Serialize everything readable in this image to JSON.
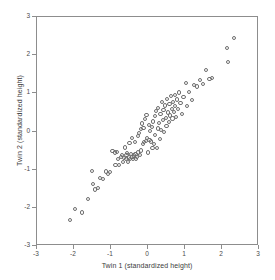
{
  "chart_data": {
    "type": "scatter",
    "title": "",
    "xlabel": "Twin 1 (standardized height)",
    "ylabel": "Twin 2 (standardized height)",
    "xlim": [
      -3,
      3
    ],
    "ylim": [
      -3,
      3
    ],
    "xticks": [
      -3,
      -2,
      -1,
      0,
      1,
      2,
      3
    ],
    "yticks": [
      -3,
      -2,
      -1,
      0,
      1,
      2,
      3
    ],
    "xtick_labels": [
      "-3",
      "-2",
      "-1",
      "0",
      "1",
      "2",
      "3"
    ],
    "ytick_labels": [
      "-3",
      "-2",
      "-1",
      "0",
      "1",
      "2",
      "3"
    ],
    "grid": false,
    "legend": null,
    "marker": "open-circle",
    "marker_color": "#6e6e6e",
    "frame_color": "#8d8d8d",
    "series": [
      {
        "name": "twin-pairs",
        "n_points": 112,
        "points": [
          [
            -2.1,
            -2.32
          ],
          [
            -1.98,
            -2.03
          ],
          [
            -1.78,
            -2.12
          ],
          [
            -1.62,
            -1.77
          ],
          [
            -1.52,
            -1.04
          ],
          [
            -1.48,
            -1.37
          ],
          [
            -1.44,
            -1.52
          ],
          [
            -1.36,
            -1.48
          ],
          [
            -1.3,
            -1.22
          ],
          [
            -1.22,
            -1.24
          ],
          [
            -1.14,
            -1.05
          ],
          [
            -1.08,
            -1.12
          ],
          [
            -1.02,
            -1.07
          ],
          [
            -0.96,
            -0.52
          ],
          [
            -0.9,
            -0.55
          ],
          [
            -0.88,
            -0.88
          ],
          [
            -0.84,
            -0.54
          ],
          [
            -0.8,
            -0.72
          ],
          [
            -0.78,
            -0.88
          ],
          [
            -0.74,
            -0.67
          ],
          [
            -0.7,
            -0.62
          ],
          [
            -0.68,
            -0.8
          ],
          [
            -0.64,
            -0.7
          ],
          [
            -0.62,
            -0.42
          ],
          [
            -0.6,
            -0.72
          ],
          [
            -0.58,
            -0.62
          ],
          [
            -0.56,
            -0.57
          ],
          [
            -0.54,
            -0.79
          ],
          [
            -0.52,
            -0.68
          ],
          [
            -0.5,
            -0.31
          ],
          [
            -0.48,
            -0.73
          ],
          [
            -0.46,
            -0.6
          ],
          [
            -0.44,
            -0.18
          ],
          [
            -0.42,
            -0.66
          ],
          [
            -0.4,
            -0.72
          ],
          [
            -0.38,
            -0.63
          ],
          [
            -0.36,
            -0.27
          ],
          [
            -0.34,
            -0.58
          ],
          [
            -0.32,
            -0.71
          ],
          [
            -0.3,
            -0.66
          ],
          [
            -0.28,
            -0.12
          ],
          [
            -0.26,
            -0.55
          ],
          [
            -0.24,
            -0.04
          ],
          [
            -0.22,
            -0.62
          ],
          [
            -0.2,
            0.06
          ],
          [
            -0.18,
            -0.5
          ],
          [
            -0.16,
            0.21
          ],
          [
            -0.14,
            -0.33
          ],
          [
            -0.12,
            0.1
          ],
          [
            -0.1,
            -0.28
          ],
          [
            -0.08,
            0.32
          ],
          [
            -0.06,
            -0.24
          ],
          [
            -0.04,
            0.44
          ],
          [
            -0.02,
            -0.16
          ],
          [
            0.0,
            -0.55
          ],
          [
            0.02,
            0.18
          ],
          [
            0.04,
            -0.22
          ],
          [
            0.06,
            0.02
          ],
          [
            0.08,
            -0.26
          ],
          [
            0.1,
            0.12
          ],
          [
            0.12,
            -0.44
          ],
          [
            0.14,
            0.26
          ],
          [
            0.16,
            -0.32
          ],
          [
            0.18,
            0.4
          ],
          [
            0.2,
            -0.1
          ],
          [
            0.22,
            0.54
          ],
          [
            0.24,
            -0.44
          ],
          [
            0.26,
            0.08
          ],
          [
            0.28,
            0.62
          ],
          [
            0.3,
            0.22
          ],
          [
            0.32,
            -0.2
          ],
          [
            0.34,
            0.46
          ],
          [
            0.36,
            0.04
          ],
          [
            0.38,
            0.78
          ],
          [
            0.4,
            0.3
          ],
          [
            0.42,
            0.56
          ],
          [
            0.44,
            -0.02
          ],
          [
            0.46,
            0.68
          ],
          [
            0.48,
            0.36
          ],
          [
            0.5,
            0.14
          ],
          [
            0.52,
            0.86
          ],
          [
            0.54,
            0.5
          ],
          [
            0.56,
            0.24
          ],
          [
            0.58,
            0.72
          ],
          [
            0.6,
            0.42
          ],
          [
            0.62,
            0.92
          ],
          [
            0.64,
            0.6
          ],
          [
            0.66,
            0.34
          ],
          [
            0.68,
            0.78
          ],
          [
            0.7,
            0.52
          ],
          [
            0.72,
            0.96
          ],
          [
            0.74,
            0.66
          ],
          [
            0.76,
            0.38
          ],
          [
            0.78,
            0.84
          ],
          [
            0.8,
            0.58
          ],
          [
            0.84,
            1.02
          ],
          [
            0.88,
            0.74
          ],
          [
            0.92,
            0.46
          ],
          [
            0.96,
            0.9
          ],
          [
            1.02,
            1.28
          ],
          [
            1.06,
            0.66
          ],
          [
            1.1,
            1.04
          ],
          [
            1.18,
            0.82
          ],
          [
            1.24,
            1.22
          ],
          [
            1.32,
            1.18
          ],
          [
            1.4,
            1.34
          ],
          [
            1.48,
            1.24
          ],
          [
            1.56,
            1.62
          ],
          [
            1.66,
            1.38
          ],
          [
            1.74,
            1.4
          ],
          [
            2.14,
            2.18
          ],
          [
            2.16,
            1.82
          ],
          [
            2.32,
            2.44
          ]
        ]
      }
    ]
  }
}
